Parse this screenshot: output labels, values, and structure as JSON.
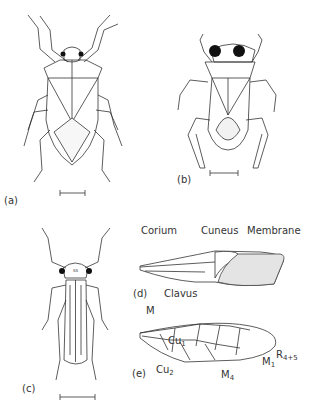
{
  "figure": {
    "panels": [
      {
        "id": "a",
        "label": "(a)",
        "description": "Dorsal view of bug with broad body"
      },
      {
        "id": "b",
        "label": "(b)",
        "description": "Dorsal view of aquatic bug with large eyes"
      },
      {
        "id": "c",
        "label": "(c)",
        "description": "Dorsal view of slender bug with long legs"
      },
      {
        "id": "d",
        "label": "(d)",
        "description": "Hemelytron forewing"
      },
      {
        "id": "e",
        "label": "(e)",
        "description": "Wing venation"
      }
    ],
    "wing_d_labels": {
      "corium": "Corium",
      "cuneus": "Cuneus",
      "membrane": "Membrane",
      "clavus": "Clavus"
    },
    "wing_e_labels": {
      "m": "M",
      "cu1": "Cu",
      "cu1_sub": "1",
      "cu2": "Cu",
      "cu2_sub": "2",
      "m4": "M",
      "m4_sub": "4",
      "m1": "M",
      "m1_sub": "1",
      "r45": "R",
      "r45_sub": "4+5"
    }
  }
}
